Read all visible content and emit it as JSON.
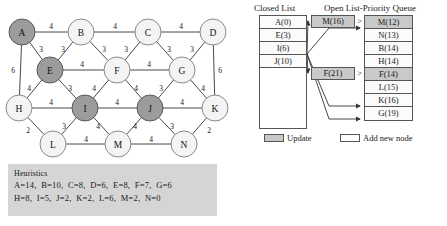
{
  "graph": {
    "nodes": [
      {
        "id": "A",
        "label": "A",
        "x": 22,
        "y": 32,
        "shaded": true
      },
      {
        "id": "B",
        "label": "B",
        "x": 81,
        "y": 32,
        "shaded": false
      },
      {
        "id": "C",
        "label": "C",
        "x": 148,
        "y": 32,
        "shaded": false
      },
      {
        "id": "D",
        "label": "D",
        "x": 213,
        "y": 32,
        "shaded": false
      },
      {
        "id": "E",
        "label": "E",
        "x": 50,
        "y": 70,
        "shaded": true
      },
      {
        "id": "F",
        "label": "F",
        "x": 117,
        "y": 70,
        "shaded": false
      },
      {
        "id": "G",
        "label": "G",
        "x": 182,
        "y": 70,
        "shaded": false
      },
      {
        "id": "H",
        "label": "H",
        "x": 19,
        "y": 108,
        "shaded": false
      },
      {
        "id": "I",
        "label": "I",
        "x": 85,
        "y": 108,
        "shaded": true
      },
      {
        "id": "J",
        "label": "J",
        "x": 150,
        "y": 108,
        "shaded": true
      },
      {
        "id": "K",
        "label": "K",
        "x": 215,
        "y": 108,
        "shaded": false
      },
      {
        "id": "L",
        "label": "L",
        "x": 53,
        "y": 144,
        "shaded": false
      },
      {
        "id": "M",
        "label": "M",
        "x": 118,
        "y": 144,
        "shaded": false
      },
      {
        "id": "N",
        "label": "N",
        "x": 184,
        "y": 144,
        "shaded": false
      }
    ],
    "node_radius": 13,
    "edges": [
      {
        "from": "A",
        "to": "B",
        "weight": "4",
        "lx": 51,
        "ly": 26
      },
      {
        "from": "B",
        "to": "C",
        "weight": "4",
        "lx": 115,
        "ly": 26
      },
      {
        "from": "C",
        "to": "D",
        "weight": "4",
        "lx": 181,
        "ly": 26
      },
      {
        "from": "A",
        "to": "E",
        "weight": "3",
        "lx": 41,
        "ly": 49
      },
      {
        "from": "B",
        "to": "E",
        "weight": "3",
        "lx": 63,
        "ly": 49
      },
      {
        "from": "B",
        "to": "F",
        "weight": "3",
        "lx": 104,
        "ly": 49
      },
      {
        "from": "C",
        "to": "F",
        "weight": "3",
        "lx": 126,
        "ly": 49
      },
      {
        "from": "C",
        "to": "G",
        "weight": "3",
        "lx": 169,
        "ly": 49
      },
      {
        "from": "D",
        "to": "G",
        "weight": "3",
        "lx": 192,
        "ly": 49
      },
      {
        "from": "A",
        "to": "H",
        "weight": "6",
        "lx": 13,
        "ly": 70
      },
      {
        "from": "D",
        "to": "K",
        "weight": "6",
        "lx": 220,
        "ly": 70
      },
      {
        "from": "E",
        "to": "F",
        "weight": "4",
        "lx": 82,
        "ly": 64
      },
      {
        "from": "F",
        "to": "G",
        "weight": "4",
        "lx": 149,
        "ly": 64
      },
      {
        "from": "E",
        "to": "H",
        "weight": "4",
        "lx": 29,
        "ly": 88
      },
      {
        "from": "E",
        "to": "I",
        "weight": "3",
        "lx": 70,
        "ly": 88
      },
      {
        "from": "F",
        "to": "I",
        "weight": "4",
        "lx": 94,
        "ly": 88
      },
      {
        "from": "F",
        "to": "J",
        "weight": "4",
        "lx": 136,
        "ly": 88
      },
      {
        "from": "G",
        "to": "J",
        "weight": "3",
        "lx": 161,
        "ly": 88
      },
      {
        "from": "G",
        "to": "K",
        "weight": "4",
        "lx": 203,
        "ly": 88
      },
      {
        "from": "H",
        "to": "I",
        "weight": "4",
        "lx": 51,
        "ly": 102
      },
      {
        "from": "I",
        "to": "J",
        "weight": "4",
        "lx": 117,
        "ly": 102
      },
      {
        "from": "J",
        "to": "K",
        "weight": "4",
        "lx": 182,
        "ly": 102
      },
      {
        "from": "H",
        "to": "L",
        "weight": "2",
        "lx": 28,
        "ly": 130
      },
      {
        "from": "I",
        "to": "L",
        "weight": "3",
        "lx": 64,
        "ly": 126
      },
      {
        "from": "I",
        "to": "M",
        "weight": "4",
        "lx": 98,
        "ly": 126
      },
      {
        "from": "J",
        "to": "M",
        "weight": "4",
        "lx": 135,
        "ly": 126
      },
      {
        "from": "J",
        "to": "N",
        "weight": "3",
        "lx": 172,
        "ly": 126
      },
      {
        "from": "K",
        "to": "N",
        "weight": "2",
        "lx": 209,
        "ly": 130
      },
      {
        "from": "L",
        "to": "M",
        "weight": "4",
        "lx": 86,
        "ly": 139
      },
      {
        "from": "M",
        "to": "N",
        "weight": "4",
        "lx": 151,
        "ly": 139
      }
    ]
  },
  "heuristics": {
    "title": "Heuristics",
    "line1": "A=14,  B=10,  C=8,  D=6,  E=8,  F=7,  G=6",
    "line2": "H=8,  I=5,  J=2,  K=2,  L=6,  M=2,  N=0"
  },
  "closed_list": {
    "heading": "Closed List",
    "rows": [
      "A(0)",
      "E(3)",
      "I(6)",
      "J(10)"
    ]
  },
  "open_list": {
    "heading": "Open List-Priority Queue",
    "rows": [
      {
        "label": "M(12)",
        "shaded": true
      },
      {
        "label": "N(13)",
        "shaded": false
      },
      {
        "label": "B(14)",
        "shaded": false
      },
      {
        "label": "H(14)",
        "shaded": false
      },
      {
        "label": "F(14)",
        "shaded": true
      },
      {
        "label": "L(15)",
        "shaded": false
      },
      {
        "label": "K(16)",
        "shaded": false
      },
      {
        "label": "G(19)",
        "shaded": false
      }
    ]
  },
  "update_boxes": [
    {
      "label": "M(16)",
      "comparator": ">"
    },
    {
      "label": "F(21)",
      "comparator": ">"
    }
  ],
  "legend": {
    "update_label": "Update",
    "add_label": "Add new node"
  },
  "colors": {
    "shaded_node": "#9c9c9c",
    "light_node": "#f4f4f4",
    "panel_gray": "#d5d5d5",
    "row_gray": "#c9c9c9"
  }
}
